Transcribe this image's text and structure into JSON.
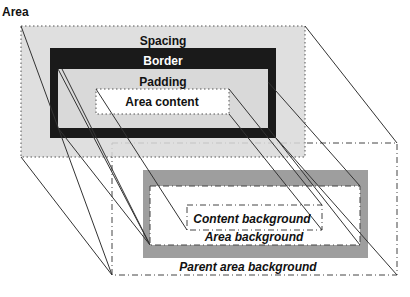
{
  "diagram": {
    "top_layer": {
      "area_label": "Area",
      "spacing_label": "Spacing",
      "border_label": "Border",
      "padding_label": "Padding",
      "content_label": "Area content"
    },
    "bottom_layer": {
      "content_background_label": "Content background",
      "area_background_label": "Area background",
      "parent_area_background_label": "Parent area background"
    },
    "colors": {
      "spacing_fill": "#d9d9d9",
      "border_fill": "#1a1a1a",
      "padding_fill": "#d9d9d9",
      "content_fill": "#ffffff",
      "gray_frame": "#9e9e9e",
      "line": "#333333"
    }
  }
}
